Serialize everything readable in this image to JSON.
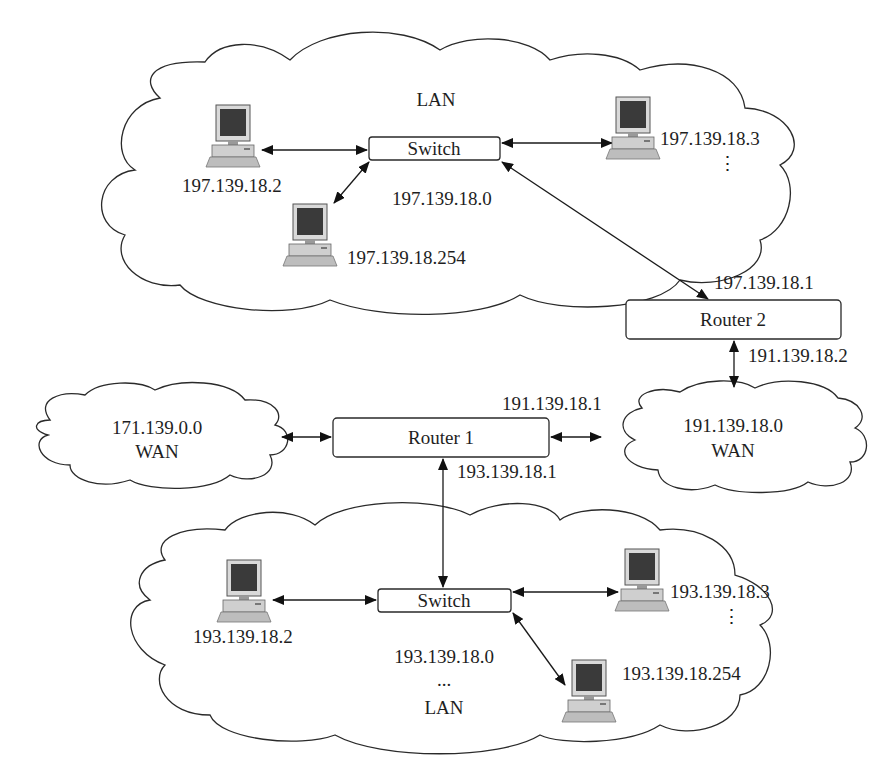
{
  "diagram": {
    "type": "network-topology",
    "top_lan": {
      "label": "LAN",
      "network": "197.139.18.0",
      "switch_label": "Switch",
      "hosts": [
        {
          "ip": "197.139.18.2"
        },
        {
          "ip": "197.139.18.3"
        },
        {
          "ip": "197.139.18.254"
        }
      ],
      "ellipsis": "⋮"
    },
    "router2": {
      "label": "Router 2",
      "lan_interface_ip": "197.139.18.1",
      "wan_interface_ip": "191.139.18.2"
    },
    "router1": {
      "label": "Router 1",
      "wan_interface_ip": "191.139.18.1",
      "lan_interface_ip": "193.139.18.1"
    },
    "wan_left": {
      "network": "171.139.0.0",
      "label": "WAN"
    },
    "wan_right": {
      "network": "191.139.18.0",
      "label": "WAN"
    },
    "bottom_lan": {
      "label": "LAN",
      "network": "193.139.18.0",
      "network_ellipsis": "...",
      "switch_label": "Switch",
      "hosts": [
        {
          "ip": "193.139.18.2"
        },
        {
          "ip": "193.139.18.3"
        },
        {
          "ip": "193.139.18.254"
        }
      ],
      "ellipsis": "⋮"
    },
    "connections": [
      {
        "from": "197.139.18.2",
        "to": "top-switch"
      },
      {
        "from": "197.139.18.3",
        "to": "top-switch"
      },
      {
        "from": "197.139.18.254",
        "to": "top-switch"
      },
      {
        "from": "top-switch",
        "to": "Router 2"
      },
      {
        "from": "Router 2",
        "to": "191.139.18.0 WAN"
      },
      {
        "from": "171.139.0.0 WAN",
        "to": "Router 1"
      },
      {
        "from": "Router 1",
        "to": "191.139.18.0 WAN"
      },
      {
        "from": "Router 1",
        "to": "bottom-switch"
      },
      {
        "from": "193.139.18.2",
        "to": "bottom-switch"
      },
      {
        "from": "193.139.18.3",
        "to": "bottom-switch"
      },
      {
        "from": "193.139.18.254",
        "to": "bottom-switch"
      }
    ]
  }
}
